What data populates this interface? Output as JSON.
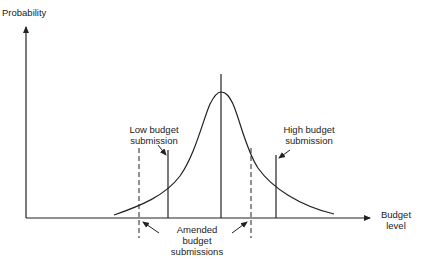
{
  "diagram": {
    "y_axis_label": "Probability",
    "x_axis_label_line1": "Budget",
    "x_axis_label_line2": "level",
    "low_label_line1": "Low budget",
    "low_label_line2": "submission",
    "high_label_line1": "High budget",
    "high_label_line2": "submission",
    "amended_label_line1": "Amended",
    "amended_label_line2": "budget",
    "amended_label_line3": "submissions",
    "colors": {
      "line": "#222222",
      "background": "#ffffff"
    },
    "elements": {
      "curve": "bell-shaped probability distribution peaking at the central line",
      "central_line": "vertical line at distribution mean",
      "low_submission_line": "solid vertical line left of mean",
      "high_submission_line": "solid vertical line right of mean",
      "amended_lines": "two dashed vertical lines, one on each side, closer to the mean"
    }
  }
}
